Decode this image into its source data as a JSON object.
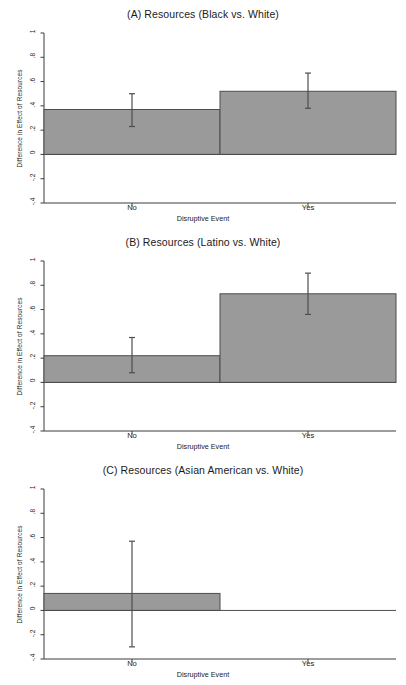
{
  "figure": {
    "width": 406,
    "height": 685,
    "background": "#ffffff",
    "bar_fill": "#9a9a9a",
    "bar_stroke": "#4d4d4d",
    "axis_color": "#3c3c3c",
    "errorbar_color": "#4d4d4d",
    "text_color": "#1a1a1a"
  },
  "axis": {
    "ylabel": "Difference in Effect of Resources",
    "xlabel": "Disruptive Event",
    "ytick_labels": [
      "1",
      ".8",
      ".6",
      ".4",
      ".2",
      "0",
      "-.2",
      "-.4"
    ],
    "ytick_values": [
      1,
      0.8,
      0.6,
      0.4,
      0.2,
      0,
      -0.2,
      -0.4
    ],
    "xtick_labels": [
      "No",
      "Yes"
    ],
    "ylim": [
      -0.4,
      1.0
    ]
  },
  "panels": [
    {
      "id": "panel-a",
      "letter": "(A)",
      "title": "(A) Resources (Black vs. White)"
    },
    {
      "id": "panel-b",
      "letter": "(B)",
      "title": "(B) Resources (Latino vs. White)"
    },
    {
      "id": "panel-c",
      "letter": "(C)",
      "title": "(C) Resources (Asian American vs. White)"
    }
  ],
  "chart_data": [
    {
      "type": "bar",
      "title": "(A) Resources (Black vs. White)",
      "xlabel": "Disruptive Event",
      "ylabel": "Difference in Effect of Resources",
      "categories": [
        "No",
        "Yes"
      ],
      "values": [
        0.37,
        0.52
      ],
      "error_low": [
        0.23,
        0.38
      ],
      "error_high": [
        0.5,
        0.67
      ],
      "ylim": [
        -0.4,
        1.0
      ],
      "yticks": [
        -0.4,
        -0.2,
        0,
        0.2,
        0.4,
        0.6,
        0.8,
        1.0
      ],
      "grid": false,
      "legend": "none"
    },
    {
      "type": "bar",
      "title": "(B) Resources (Latino vs. White)",
      "xlabel": "Disruptive Event",
      "ylabel": "Difference in Effect of Resources",
      "categories": [
        "No",
        "Yes"
      ],
      "values": [
        0.22,
        0.73
      ],
      "error_low": [
        0.08,
        0.56
      ],
      "error_high": [
        0.37,
        0.9
      ],
      "ylim": [
        -0.4,
        1.0
      ],
      "yticks": [
        -0.4,
        -0.2,
        0,
        0.2,
        0.4,
        0.6,
        0.8,
        1.0
      ],
      "grid": false,
      "legend": "none"
    },
    {
      "type": "bar",
      "title": "(C) Resources (Asian American vs. White)",
      "xlabel": "Disruptive Event",
      "ylabel": "Difference in Effect of Resources",
      "categories": [
        "No",
        "Yes"
      ],
      "values": [
        0.14,
        0.0
      ],
      "error_low": [
        -0.3,
        null
      ],
      "error_high": [
        0.57,
        null
      ],
      "ylim": [
        -0.4,
        1.0
      ],
      "yticks": [
        -0.4,
        -0.2,
        0,
        0.2,
        0.4,
        0.6,
        0.8,
        1.0
      ],
      "grid": false,
      "legend": "none"
    }
  ]
}
